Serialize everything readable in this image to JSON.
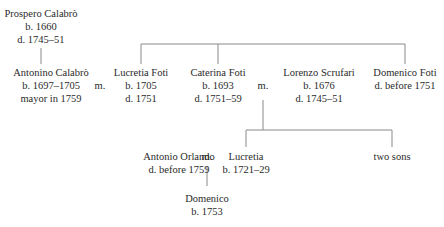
{
  "diagram_type": "family tree",
  "people": {
    "prospero": {
      "name": "Prospero Calabrò",
      "lines": [
        "b. 1660",
        "d. 1745–51"
      ]
    },
    "antonino": {
      "name": "Antonino Calabrò",
      "lines": [
        "b. 1697–1705",
        "mayor in 1759"
      ]
    },
    "lucretia_foti": {
      "name": "Lucretia Foti",
      "lines": [
        "b. 1705",
        "d. 1751"
      ]
    },
    "caterina": {
      "name": "Caterina Foti",
      "lines": [
        "b. 1693",
        "d. 1751–59"
      ]
    },
    "lorenzo": {
      "name": "Lorenzo Scrufari",
      "lines": [
        "b. 1676",
        "d. 1745–51"
      ]
    },
    "domenico_foti": {
      "name": "Domenico Foti",
      "lines": [
        "d. before 1751"
      ]
    },
    "antonio": {
      "name": "Antonio Orlando",
      "lines": [
        "d. before 1759"
      ]
    },
    "lucretia": {
      "name": "Lucretia",
      "lines": [
        "b. 1721–29"
      ]
    },
    "two_sons": {
      "name": "two sons",
      "lines": []
    },
    "domenico": {
      "name": "Domenico",
      "lines": [
        "b. 1753"
      ]
    }
  },
  "marriage_label": "m.",
  "relations": [
    {
      "type": "parent-child",
      "parent": "Prospero Calabrò",
      "child": "Antonino Calabrò"
    },
    {
      "type": "marriage",
      "a": "Antonino Calabrò",
      "b": "Lucretia Foti"
    },
    {
      "type": "siblings",
      "members": [
        "Lucretia Foti",
        "Caterina Foti",
        "Domenico Foti"
      ]
    },
    {
      "type": "marriage",
      "a": "Caterina Foti",
      "b": "Lorenzo Scrufari"
    },
    {
      "type": "parent-child",
      "parents": [
        "Caterina Foti",
        "Lorenzo Scrufari"
      ],
      "children": [
        "Lucretia",
        "two sons"
      ]
    },
    {
      "type": "marriage",
      "a": "Antonio Orlando",
      "b": "Lucretia"
    },
    {
      "type": "parent-child",
      "parents": [
        "Antonio Orlando",
        "Lucretia"
      ],
      "child": "Domenico"
    }
  ]
}
